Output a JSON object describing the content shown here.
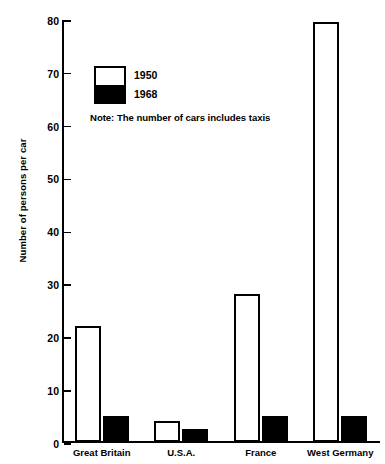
{
  "chart_data": {
    "type": "bar",
    "title": "",
    "xlabel": "",
    "ylabel": "Number of  persons per car",
    "ylim": [
      0,
      80
    ],
    "ytick_step": 10,
    "yticks": [
      80,
      70,
      60,
      50,
      40,
      30,
      20,
      10,
      0
    ],
    "grid": false,
    "legend_position": "upper-left-inside",
    "categories": [
      "Great Britain",
      "U.S.A.",
      "France",
      "West Germany"
    ],
    "series": [
      {
        "name": "1950",
        "values": [
          22,
          4,
          28,
          79.5
        ],
        "color": "#ffffff"
      },
      {
        "name": "1968",
        "values": [
          5,
          2.5,
          5,
          5
        ],
        "color": "#000000"
      }
    ],
    "annotations": [
      "Note: The number of cars  includes taxis"
    ]
  },
  "legend": {
    "entries": [
      {
        "label": "1950",
        "swatch": "white"
      },
      {
        "label": "1968",
        "swatch": "black"
      }
    ]
  },
  "note": {
    "text": "Note: The number of cars  includes taxis"
  }
}
